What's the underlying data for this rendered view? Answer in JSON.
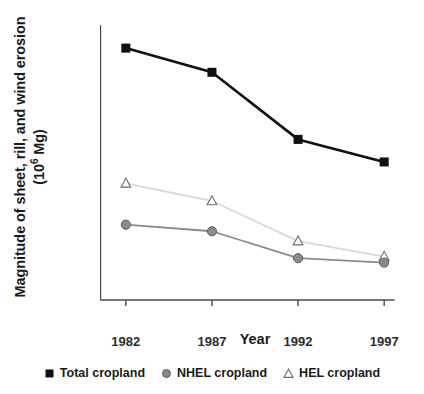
{
  "chart_data": {
    "type": "line",
    "title": "",
    "xlabel": "Year",
    "ylabel": "Magnitude of sheet, rill, and wind erosion (10⁶ Mg)",
    "ylabel_line1": "Magnitude of sheet, rill, and wind erosion",
    "ylabel_line2_pre": "(10",
    "ylabel_line2_sup": "6",
    "ylabel_line2_post": " Mg)",
    "categories": [
      "1982",
      "1987",
      "1992",
      "1997"
    ],
    "x": [
      1982,
      1987,
      1992,
      1997
    ],
    "xlim": [
      1980.5,
      1998.5
    ],
    "ylim": [
      500,
      3000
    ],
    "yticks": [
      500,
      1000,
      1500,
      2000,
      2500,
      3000
    ],
    "ytick_labels": [
      "500",
      "1000",
      "1500",
      "2000",
      "2500",
      "3000"
    ],
    "xticks": [
      1982,
      1987,
      1992,
      1997
    ],
    "xtick_labels": [
      "1982",
      "1987",
      "1992",
      "1997"
    ],
    "grid": false,
    "legend_position": "bottom-center",
    "series": [
      {
        "name": "Total cropland",
        "marker": "filled-square",
        "color": "#111111",
        "line_color": "#111111",
        "values": [
          2790,
          2570,
          1960,
          1755
        ]
      },
      {
        "name": "NHEL cropland",
        "marker": "filled-circle",
        "color": "#8a8a8a",
        "line_color": "#8a8a8a",
        "values": [
          1185,
          1125,
          880,
          840
        ]
      },
      {
        "name": "HEL cropland",
        "marker": "open-triangle",
        "color": "#6e6e6e",
        "line_color": "#d9d9d9",
        "values": [
          1560,
          1400,
          1035,
          895
        ]
      }
    ],
    "axis_color": "#4a4a4a",
    "legend_entries": [
      {
        "label": "Total cropland",
        "marker": "filled-square"
      },
      {
        "label": "NHEL cropland",
        "marker": "filled-circle"
      },
      {
        "label": "HEL cropland",
        "marker": "open-triangle"
      }
    ]
  }
}
